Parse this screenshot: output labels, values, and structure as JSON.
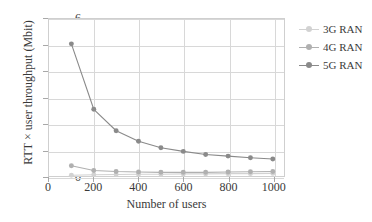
{
  "chart_data": {
    "type": "line",
    "title": "",
    "xlabel": "Number of users",
    "ylabel": "RTT × user throughput (Mbit)",
    "xlim": [
      0,
      1050
    ],
    "ylim": [
      0,
      6
    ],
    "xticks": [
      0,
      200,
      400,
      600,
      800,
      1000
    ],
    "yticks": [
      0,
      1,
      2,
      3,
      4,
      5,
      6
    ],
    "grid": true,
    "legend_position": "right",
    "x": [
      100,
      200,
      300,
      400,
      500,
      600,
      700,
      800,
      900,
      1000
    ],
    "series": [
      {
        "name": "3G RAN",
        "color": "#d2d2d2",
        "values": [
          0.03,
          0.05,
          0.06,
          0.07,
          0.07,
          0.08,
          0.08,
          0.09,
          0.09,
          0.1
        ]
      },
      {
        "name": "4G RAN",
        "color": "#b0b0b0",
        "values": [
          0.39,
          0.21,
          0.17,
          0.15,
          0.14,
          0.14,
          0.14,
          0.15,
          0.16,
          0.17
        ]
      },
      {
        "name": "5G RAN",
        "color": "#8a8a8a",
        "values": [
          5.05,
          2.55,
          1.73,
          1.33,
          1.08,
          0.94,
          0.82,
          0.76,
          0.7,
          0.65
        ]
      }
    ]
  },
  "legend": {
    "items": [
      {
        "label": "3G RAN"
      },
      {
        "label": "4G RAN"
      },
      {
        "label": "5G RAN"
      }
    ]
  },
  "axes": {
    "xtick_labels": [
      "0",
      "200",
      "400",
      "600",
      "800",
      "1000"
    ],
    "ytick_labels": [
      "0",
      "1",
      "2",
      "3",
      "4",
      "5",
      "6"
    ]
  },
  "colors": {
    "grid": "#d8d8d8",
    "frame": "#cfcfcf",
    "text": "#3a3a3a",
    "series_3g": "#d2d2d2",
    "series_4g": "#b0b0b0",
    "series_5g": "#8a8a8a"
  }
}
